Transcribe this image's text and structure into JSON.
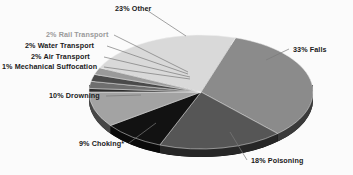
{
  "chart_data": {
    "type": "pie",
    "title": "",
    "subtitle": "",
    "xlabel": "",
    "ylabel": "",
    "legend_position": "callout-labels",
    "grid": false,
    "style": "3d-pie",
    "total_percent": 100,
    "categories": [
      "Falls",
      "Poisoning",
      "Choking*",
      "Drowning",
      "Mechanical Suffocation",
      "Air Transport",
      "Water Transport",
      "Rail Transport",
      "Other"
    ],
    "values": [
      33,
      18,
      9,
      10,
      1,
      2,
      2,
      2,
      23
    ],
    "labels": [
      "33% Falls",
      "18% Poisoning",
      "9% Choking*",
      "10% Drowning",
      "1% Mechanical Suffocation",
      "2% Air Transport",
      "2% Water Transport",
      "2% Rail Transport",
      "23% Other"
    ],
    "colors": [
      "#8b8b8b",
      "#565656",
      "#121212",
      "#a3a3a3",
      "#2c2c2c",
      "#6e6e6e",
      "#4a4a4a",
      "#9a9a9a",
      "#d9d9d9"
    ],
    "annotations": [
      "*"
    ]
  },
  "slices": [
    {
      "name": "falls",
      "label": "33% Falls",
      "value": 33,
      "color": "#8b8b8b",
      "side_color": "#3a3a3a"
    },
    {
      "name": "poisoning",
      "label": "18% Poisoning",
      "value": 18,
      "color": "#565656",
      "side_color": "#262626"
    },
    {
      "name": "choking",
      "label": "9% Choking*",
      "value": 9,
      "color": "#121212",
      "side_color": "#0a0a0a"
    },
    {
      "name": "drowning",
      "label": "10% Drowning",
      "value": 10,
      "color": "#a3a3a3",
      "side_color": "#474747"
    },
    {
      "name": "mechanical-suffocation",
      "label": "1% Mechanical Suffocation",
      "value": 1,
      "color": "#2c2c2c",
      "side_color": "#181818"
    },
    {
      "name": "air-transport",
      "label": "2% Air Transport",
      "value": 2,
      "color": "#6e6e6e",
      "side_color": "#303030"
    },
    {
      "name": "water-transport",
      "label": "2% Water Transport",
      "value": 2,
      "color": "#4a4a4a",
      "side_color": "#222222"
    },
    {
      "name": "rail-transport",
      "label": "2% Rail Transport",
      "value": 2,
      "color": "#9a9a9a",
      "side_color": "#424242"
    },
    {
      "name": "other",
      "label": "23% Other",
      "value": 23,
      "color": "#d9d9d9",
      "side_color": "#5c5c5c"
    }
  ],
  "callouts": {
    "other": "23% Other",
    "falls": "33% Falls",
    "poisoning": "18% Poisoning",
    "choking": "9% Choking*",
    "drowning": "10% Drowning",
    "mechanical_suffocation": "1% Mechanical Suffocation",
    "air_transport": "2% Air Transport",
    "water_transport": "2% Water Transport",
    "rail_transport": "2% Rail Transport"
  }
}
